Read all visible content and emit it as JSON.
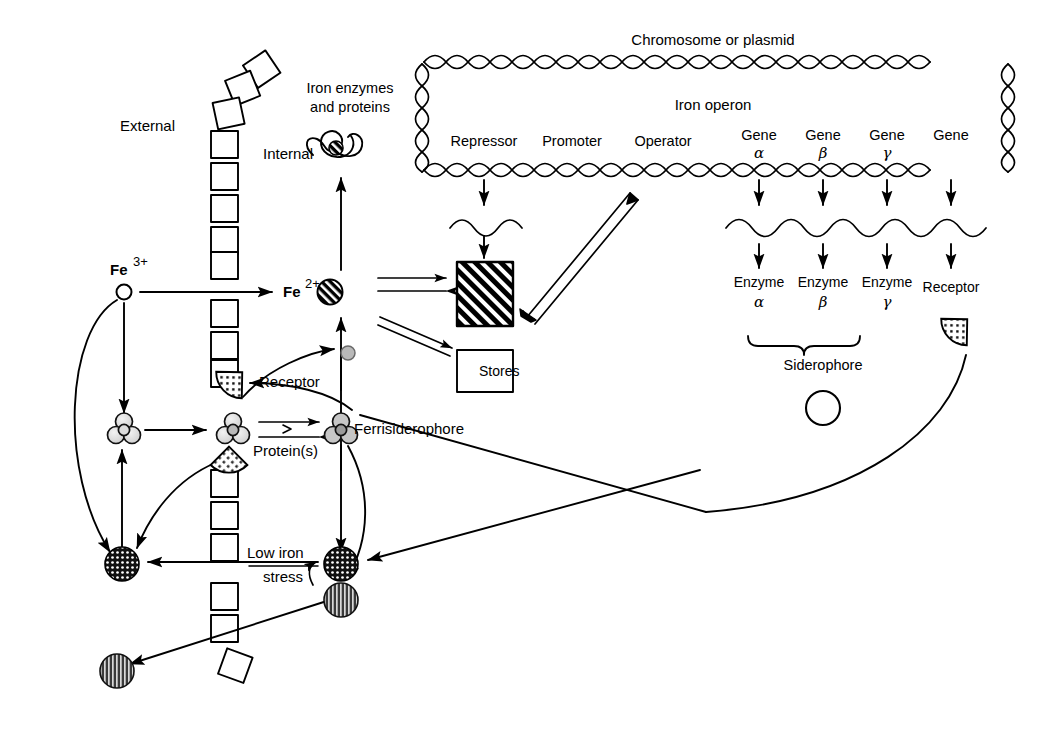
{
  "figure": {
    "type": "biological-pathway-diagram",
    "background_color": "#ffffff",
    "ink_color": "#000000"
  },
  "labels": {
    "external": "External",
    "internal": "Internal",
    "iron_enzymes": "Iron enzymes",
    "and_proteins": "and proteins",
    "fe3_element": "Fe",
    "fe3_charge": "3+",
    "fe2_element": "Fe",
    "fe2_charge": "2+",
    "receptor_membrane": "Receptor",
    "proteins_s": "Protein(s)",
    "ferrisiderophore": "Ferrisiderophore",
    "low_iron": "Low iron",
    "stress": "stress",
    "stores": "Stores",
    "siderophore": "Siderophore"
  },
  "chromosome": {
    "title": "Chromosome or plasmid",
    "operon_title": "Iron operon",
    "elements": [
      {
        "name": "Repressor",
        "sub": ""
      },
      {
        "name": "Promoter",
        "sub": ""
      },
      {
        "name": "Operator",
        "sub": ""
      },
      {
        "name": "Gene",
        "sub": "α"
      },
      {
        "name": "Gene",
        "sub": "β"
      },
      {
        "name": "Gene",
        "sub": "γ"
      },
      {
        "name": "Gene",
        "sub": ""
      }
    ]
  },
  "products": [
    {
      "name": "Enzyme",
      "sub": "α"
    },
    {
      "name": "Enzyme",
      "sub": "β"
    },
    {
      "name": "Enzyme",
      "sub": "γ"
    },
    {
      "name": "Receptor",
      "sub": ""
    }
  ],
  "icons": {
    "fe3_open_circle": "open-circle-icon",
    "fe2_striped_circle": "striped-circle-icon",
    "repressor_hatched_box": "hatched-square-icon",
    "stores_box": "stores-box-icon",
    "membrane_square": "membrane-square-icon",
    "receptor_wedge": "receptor-wedge-icon",
    "siderophore_cluster": "siderophore-cluster-icon",
    "siderophore_open_circle": "siderophore-circle-icon",
    "crosshatch_circle": "crosshatch-circle-icon",
    "vertical_stripe_circle": "vertical-stripe-circle-icon",
    "protein_squiggle": "iron-protein-squiggle-icon",
    "dna_helix": "dna-double-helix-icon",
    "mrna_wave": "mrna-wave-icon",
    "brace": "curly-brace-icon"
  }
}
